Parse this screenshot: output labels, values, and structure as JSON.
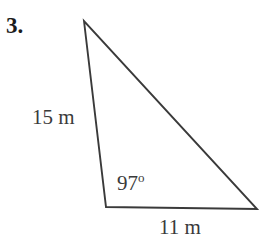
{
  "figure": {
    "problem_number": "3.",
    "shape": "triangle",
    "stroke_color": "#3a3a3a",
    "background_color": "#ffffff",
    "labels": {
      "side_left": "15 m",
      "side_bottom": "11 m",
      "angle": "97",
      "angle_unit": "o"
    },
    "geometry": {
      "vertex_apex": {
        "x": 84,
        "y": 21
      },
      "vertex_bottom_left": {
        "x": 106,
        "y": 207
      },
      "vertex_bottom_right": {
        "x": 257,
        "y": 209
      }
    }
  },
  "chart_data": {
    "type": "diagram",
    "annotations": [
      {
        "name": "side-left",
        "text": "15 m",
        "value": 15,
        "unit": "m"
      },
      {
        "name": "side-bottom",
        "text": "11 m",
        "value": 11,
        "unit": "m"
      },
      {
        "name": "included-angle",
        "text": "97o",
        "value": 97,
        "unit": "degrees"
      }
    ]
  }
}
